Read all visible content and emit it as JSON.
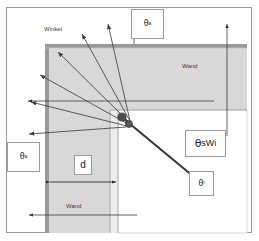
{
  "diagram": {
    "labels": {
      "winkel": "Winkel",
      "wand_top": "Wand",
      "wand_bottom": "Wand",
      "thickness": "d",
      "theta_top": "θ",
      "theta_top_sub": "a",
      "theta_left": "θ",
      "theta_left_sub": "a",
      "theta_inner": "θ",
      "theta_inner_sub": "i",
      "theta_swi": "θ",
      "theta_swi_sub": "sWi"
    },
    "colors": {
      "wall_fill": "#d2d2d2",
      "wall_border": "#8f8f8f",
      "inner_fill": "#e2e2e2",
      "ray": "#4a4a4a",
      "node": "#4d4d4d",
      "frame": "#9a9a9a",
      "text": "#1c1c1c"
    },
    "source_point": {
      "x": 130,
      "y": 121
    },
    "rays": [
      {
        "to_x": 108,
        "to_y": 22,
        "name": "ray-up-1"
      },
      {
        "to_x": 81,
        "to_y": 33,
        "name": "ray-up-2"
      },
      {
        "to_x": 57,
        "to_y": 51,
        "name": "ray-up-3"
      },
      {
        "to_x": 39,
        "to_y": 74,
        "name": "ray-up-4"
      },
      {
        "to_x": 30,
        "to_y": 101,
        "name": "ray-left-1"
      },
      {
        "to_x": 28,
        "to_y": 134,
        "name": "ray-left-2"
      },
      {
        "to_x": 211,
        "to_y": 191,
        "name": "ray-transmitted"
      }
    ],
    "dimension": {
      "label": "d",
      "from_x": 48,
      "to_x": 118,
      "y": 182
    },
    "outer_arrows": [
      {
        "x": 134,
        "from_y": 42,
        "to_y": 25,
        "name": "outer-arrow-top-1"
      },
      {
        "x": 227,
        "from_y": 135,
        "to_y": 25,
        "name": "outer-arrow-top-2"
      },
      {
        "x_from": 137,
        "x_to": 30,
        "y": 215,
        "name": "outer-arrow-bottom"
      },
      {
        "x_from": 214,
        "x_to": 27,
        "y": 101,
        "name": "outer-arrow-left-mid"
      }
    ]
  }
}
